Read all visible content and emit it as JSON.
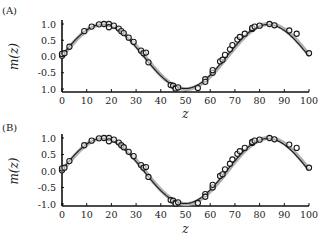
{
  "chart_data": [
    {
      "type": "line",
      "panel_label": "(A)",
      "title": "",
      "xlabel": "z",
      "ylabel": "m(z)",
      "xlim": [
        0,
        100
      ],
      "ylim": [
        -1.0,
        1.0
      ],
      "x_ticks": [
        "0",
        "10",
        "20",
        "30",
        "40",
        "50",
        "60",
        "70",
        "80",
        "90",
        "100"
      ],
      "y_ticks": [
        "1.0",
        "0.5",
        "0.0",
        "-0.5",
        "1.0"
      ],
      "grid": false,
      "legend": "none",
      "series": [
        {
          "name": "true curve",
          "style": "gray thick line",
          "function": "sin(2*pi*z/67)"
        },
        {
          "name": "fitted curve",
          "style": "black thin line",
          "function": "sin(2*pi*z/67)"
        },
        {
          "name": "observations",
          "style": "open circles",
          "x": [
            0,
            0,
            1,
            3,
            9,
            12,
            15,
            17,
            19,
            19,
            21,
            23,
            24,
            25,
            27,
            29,
            32,
            33,
            34,
            35,
            44,
            45,
            46,
            46,
            47,
            55,
            58,
            58,
            61,
            61,
            64,
            65,
            66,
            68,
            69,
            71,
            72,
            74,
            77,
            77,
            78,
            80,
            84,
            86,
            92,
            95,
            100
          ],
          "y": [
            0.02,
            0.08,
            0.1,
            0.3,
            0.78,
            0.92,
            0.99,
            1.0,
            1.0,
            0.9,
            0.95,
            0.86,
            0.78,
            0.72,
            0.58,
            0.45,
            0.18,
            0.1,
            0.12,
            -0.18,
            -0.88,
            -0.9,
            -0.97,
            -0.99,
            -0.95,
            -0.97,
            -0.7,
            -0.78,
            -0.5,
            -0.42,
            -0.15,
            -0.1,
            0.05,
            0.22,
            0.35,
            0.52,
            0.6,
            0.7,
            0.85,
            0.88,
            0.92,
            0.95,
            1.0,
            0.96,
            0.8,
            0.7,
            0.1
          ]
        }
      ]
    },
    {
      "type": "line",
      "panel_label": "(B)",
      "title": "",
      "xlabel": "z",
      "ylabel": "m(z)",
      "xlim": [
        0,
        100
      ],
      "ylim": [
        -1.0,
        1.0
      ],
      "x_ticks": [
        "0",
        "10",
        "20",
        "30",
        "40",
        "50",
        "60",
        "70",
        "80",
        "90",
        "100"
      ],
      "y_ticks": [
        "1.0",
        "0.5",
        "0.0",
        "-0.5",
        "-1.0"
      ],
      "grid": false,
      "legend": "none",
      "series": [
        {
          "name": "true curve",
          "style": "gray thick line",
          "function": "sin(2*pi*z/67)"
        },
        {
          "name": "fitted curve",
          "style": "black thin line",
          "function": "sin(2*pi*z/67)"
        },
        {
          "name": "observations",
          "style": "open circles",
          "x": [
            0,
            0,
            1,
            3,
            9,
            12,
            15,
            17,
            19,
            19,
            21,
            23,
            24,
            25,
            27,
            29,
            32,
            33,
            34,
            35,
            44,
            45,
            46,
            46,
            47,
            55,
            58,
            58,
            61,
            61,
            64,
            65,
            66,
            68,
            69,
            71,
            72,
            74,
            77,
            77,
            78,
            80,
            84,
            86,
            92,
            95,
            100
          ],
          "y": [
            0.02,
            0.08,
            0.1,
            0.3,
            0.78,
            0.92,
            0.99,
            1.0,
            1.0,
            0.9,
            0.95,
            0.86,
            0.78,
            0.72,
            0.58,
            0.45,
            0.18,
            0.1,
            0.12,
            -0.18,
            -0.88,
            -0.9,
            -0.97,
            -0.99,
            -0.95,
            -0.97,
            -0.7,
            -0.78,
            -0.5,
            -0.42,
            -0.15,
            -0.1,
            0.05,
            0.22,
            0.35,
            0.52,
            0.6,
            0.7,
            0.85,
            0.88,
            0.92,
            0.95,
            1.0,
            0.96,
            0.8,
            0.7,
            0.1
          ]
        }
      ]
    }
  ],
  "layout": {
    "panels": [
      {
        "label_x": 2,
        "label_y": 14,
        "x0": 62,
        "x100": 309,
        "y_top": 24,
        "y_bottom": 89,
        "axis_y": 92,
        "tick_label_y": 104,
        "xlabel_y": 118,
        "ylabel_x": 18
      },
      {
        "label_x": 2,
        "label_y": 131,
        "x0": 62,
        "x100": 309,
        "y_top": 138,
        "y_bottom": 204,
        "axis_y": 206,
        "tick_label_y": 218,
        "xlabel_y": 233,
        "ylabel_x": 18
      }
    ],
    "colors": {
      "true_curve": "#b0b0b0",
      "fit_curve": "#1a1a1a",
      "marker": "#1a1a1a",
      "axis": "#111111"
    }
  }
}
